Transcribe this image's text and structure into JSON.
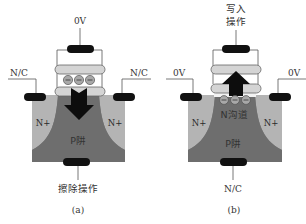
{
  "figure": {
    "panels": [
      {
        "id": "a",
        "caption": "(a)",
        "top_label": "0V",
        "left_label": "N/C",
        "right_label": "N/C",
        "bottom_label": "擦除操作",
        "left_region": "N+",
        "right_region": "N+",
        "well_label": "P阱",
        "channel_label": "",
        "electrons": [
          "−",
          "−",
          "−"
        ],
        "arrow_direction": "down"
      },
      {
        "id": "b",
        "caption": "(b)",
        "top_label_line1": "写入",
        "top_label_line2": "操作",
        "left_label": "0V",
        "right_label": "0V",
        "bottom_label": "N/C",
        "left_region": "N+",
        "right_region": "N+",
        "well_label": "P阱",
        "channel_label": "N沟道",
        "electrons": [
          "−",
          "−",
          "−"
        ],
        "arrow_direction": "up"
      }
    ],
    "colors": {
      "contact": "#111111",
      "substrate": "#7a7a7a",
      "n_plus": "#b4b4b4",
      "gate_bar": "#d4d4d4",
      "electron": "#a8a8a8",
      "line": "#555555",
      "arrow": "#0d0d0d"
    }
  }
}
